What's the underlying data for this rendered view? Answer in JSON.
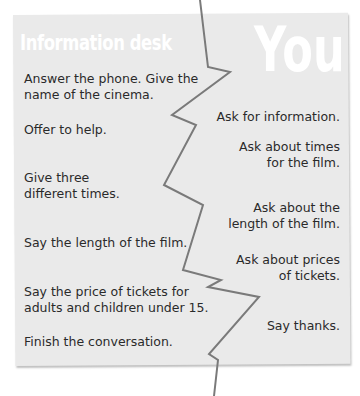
{
  "headings": {
    "left": "Information desk",
    "right": "You"
  },
  "left_column": [
    {
      "text": "Answer the phone. Give the\nname of the cinema."
    },
    {
      "text": "Offer to help."
    },
    {
      "text": "Give three\ndifferent times."
    },
    {
      "text": "Say the length of the film."
    },
    {
      "text": "Say the price of tickets for\nadults and children under 15."
    },
    {
      "text": "Finish the conversation."
    }
  ],
  "right_column": [
    {
      "text": "Ask for information."
    },
    {
      "text": "Ask about times\nfor the film."
    },
    {
      "text": "Ask about the\nlength of the film."
    },
    {
      "text": "Ask about prices\nof tickets."
    },
    {
      "text": "Say thanks."
    }
  ],
  "colors": {
    "panel": "#eaeaea",
    "heading": "#ffffff",
    "text": "#2a2a2a",
    "tear_line": "#7a7a7a"
  }
}
